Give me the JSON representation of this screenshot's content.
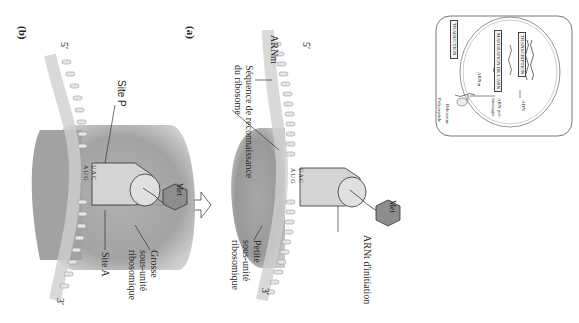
{
  "figure": {
    "orientation": "rotated 90 degrees clockwise",
    "panel_a": {
      "label": "(a)",
      "five_prime": "5′",
      "three_prime": "3′",
      "mrna": "ARNm",
      "recognition_seq": "Séquence de reconnaissance\ndu ribosome",
      "initiator_trna": "ARNt d'initiation",
      "small_subunit": "Petite\nsous-unité\nribosomique",
      "met": "Met",
      "codon": [
        "A",
        "U",
        "G"
      ],
      "anticodon": [
        "U",
        "A",
        "C"
      ]
    },
    "panel_b": {
      "label": "(b)",
      "five_prime": "5′",
      "three_prime": "3′",
      "site_p": "Site P",
      "site_a": "Site A",
      "large_subunit": "Grosse\nsous-unité\nribosomique",
      "met": "Met",
      "codon": [
        "A",
        "U",
        "G"
      ],
      "anticodon": [
        "U",
        "A",
        "C"
      ]
    },
    "inset": {
      "transcription": "TRANSCRIPTION",
      "maturation": "MATURATION DE L'ARN",
      "traduction": "TRADUCTION",
      "adn": "ADN",
      "pre_arnm": "ARN pré-\nmessager",
      "arnm": "ARNm",
      "ribosome": "Ribosome",
      "polypeptide": "Polypeptide"
    },
    "colors": {
      "ribosome": "#9a9a9a",
      "ribosome_light": "#c8c8c8",
      "trna": "#d2d2d2",
      "met": "#8a8a8a",
      "mrna": "#b5b5b5",
      "line": "#333333"
    }
  }
}
